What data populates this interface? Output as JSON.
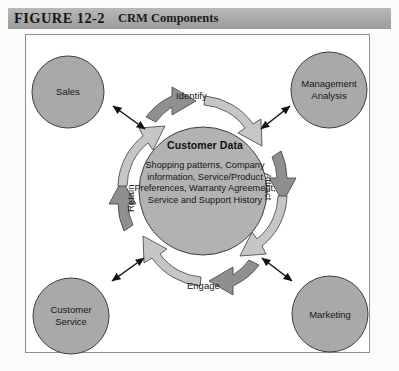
{
  "figure": {
    "number_label": "FIGURE 12-2",
    "title": "CRM Components"
  },
  "diagram": {
    "type": "cycle-diagram",
    "center": {
      "title": "Customer Data",
      "body": "Shopping patterns, Company information, Service/Product Preferences, Warranty Agreement, Service and Support History"
    },
    "cycle_steps": [
      {
        "id": "identify",
        "label": "Identify",
        "position": "top"
      },
      {
        "id": "attract",
        "label": "Attract",
        "position": "right"
      },
      {
        "id": "engage",
        "label": "Engage",
        "position": "bottom"
      },
      {
        "id": "retain",
        "label": "Retain",
        "position": "left"
      }
    ],
    "corner_nodes": [
      {
        "id": "sales",
        "label": "Sales",
        "lines": [
          "Sales"
        ],
        "position": "top-left"
      },
      {
        "id": "management-analysis",
        "label": "Management Analysis",
        "lines": [
          "Management",
          "Analysis"
        ],
        "position": "top-right"
      },
      {
        "id": "customer-service",
        "label": "Customer Service",
        "lines": [
          "Customer",
          "Service"
        ],
        "position": "bottom-left"
      },
      {
        "id": "marketing",
        "label": "Marketing",
        "lines": [
          "Marketing"
        ],
        "position": "bottom-right"
      }
    ],
    "connectors": [
      {
        "id": "sales-connector",
        "style": "double-headed-arrow"
      },
      {
        "id": "management-analysis-connector",
        "style": "double-headed-arrow"
      },
      {
        "id": "customer-service-connector",
        "style": "double-headed-arrow"
      },
      {
        "id": "marketing-connector",
        "style": "double-headed-arrow"
      }
    ],
    "colors": {
      "band": "#a8a8a8",
      "node_fill": "#a8a8a8",
      "center_fill": "#b0b0b0",
      "arrow_dark": "#8a8a8a",
      "arrow_light": "#c9c9c9",
      "outline": "#3a3a3a",
      "frame_border": "#8d8f92",
      "page_background": "#fbfbfa"
    }
  }
}
